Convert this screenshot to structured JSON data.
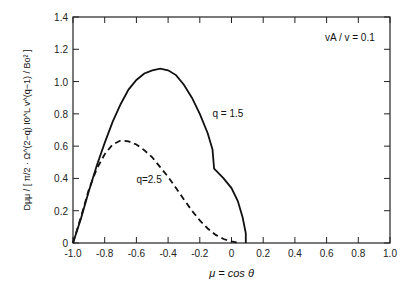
{
  "chart_data": {
    "type": "line",
    "title": "",
    "annotation": "vA / v = 0.1",
    "xlabel": "μ = cos θ",
    "ylabel": "Dμμ / [ π/2 · Ω^(2−q) I0^L v^(q−1) / Bo² ]",
    "xlim": [
      -1.0,
      1.0
    ],
    "ylim": [
      0,
      1.4
    ],
    "xticks": [
      "-1.0",
      "-0.8",
      "-0.6",
      "-0.4",
      "-0.2",
      "0",
      "0.2",
      "0.4",
      "0.6",
      "0.8",
      "1.0"
    ],
    "yticks": [
      "0",
      "0.2",
      "0.4",
      "0.6",
      "0.8",
      "1.0",
      "1.2",
      "1.4"
    ],
    "grid": false,
    "series": [
      {
        "name": "q=1.5",
        "style": "solid",
        "x": [
          -1.0,
          -0.95,
          -0.9,
          -0.85,
          -0.8,
          -0.75,
          -0.7,
          -0.65,
          -0.6,
          -0.55,
          -0.5,
          -0.45,
          -0.4,
          -0.35,
          -0.3,
          -0.25,
          -0.2,
          -0.15,
          -0.12,
          -0.11,
          -0.05,
          0.0,
          0.04,
          0.07,
          0.09,
          0.09
        ],
        "y": [
          0,
          0.15,
          0.32,
          0.48,
          0.62,
          0.75,
          0.86,
          0.95,
          1.01,
          1.05,
          1.07,
          1.08,
          1.07,
          1.04,
          0.98,
          0.9,
          0.8,
          0.68,
          0.58,
          0.46,
          0.4,
          0.34,
          0.26,
          0.16,
          0.06,
          0
        ]
      },
      {
        "name": "q=2.5",
        "style": "dashed",
        "x": [
          -1.0,
          -0.95,
          -0.9,
          -0.85,
          -0.8,
          -0.75,
          -0.7,
          -0.65,
          -0.6,
          -0.55,
          -0.5,
          -0.45,
          -0.4,
          -0.35,
          -0.3,
          -0.25,
          -0.2,
          -0.15,
          -0.1,
          -0.05,
          0.0,
          0.03,
          0.05
        ],
        "y": [
          0,
          0.16,
          0.33,
          0.46,
          0.55,
          0.61,
          0.635,
          0.63,
          0.61,
          0.575,
          0.53,
          0.47,
          0.41,
          0.34,
          0.27,
          0.2,
          0.14,
          0.09,
          0.05,
          0.025,
          0.01,
          0.004,
          0
        ]
      }
    ],
    "labels": [
      {
        "text": "q = 1.5",
        "x": -0.12,
        "y": 0.78
      },
      {
        "text": "q=2.5",
        "x": -0.6,
        "y": 0.37
      }
    ]
  }
}
